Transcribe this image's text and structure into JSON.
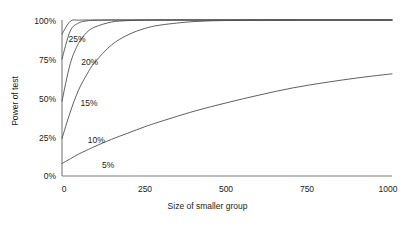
{
  "chart_data": {
    "type": "line",
    "title": "",
    "xlabel": "Size of smaller group",
    "ylabel": "Power of test",
    "xlim": [
      0,
      1000
    ],
    "ylim": [
      0,
      100
    ],
    "grid": false,
    "legend_position": "inline-labels",
    "xticks": [
      "0",
      "250",
      "500",
      "750",
      "1000"
    ],
    "xtick_values": [
      0,
      250,
      500,
      750,
      1000
    ],
    "yticks": [
      "0%",
      "25%",
      "50%",
      "75%",
      "100%"
    ],
    "ytick_values": [
      0,
      25,
      50,
      75,
      100
    ],
    "x": [
      0,
      25,
      50,
      75,
      100,
      150,
      200,
      250,
      300,
      400,
      500,
      600,
      700,
      800,
      900,
      1000
    ],
    "series": [
      {
        "name": "25%",
        "label": "25%",
        "values": [
          91,
          99.2,
          99.9,
          100,
          100,
          100,
          100,
          100,
          100,
          100,
          100,
          100,
          100,
          100,
          100,
          100
        ]
      },
      {
        "name": "20%",
        "label": "20%",
        "values": [
          75,
          93,
          98,
          99.4,
          99.8,
          100,
          100,
          100,
          100,
          100,
          100,
          100,
          100,
          100,
          100,
          100
        ]
      },
      {
        "name": "15%",
        "label": "15%",
        "values": [
          48,
          72,
          85,
          92,
          95.5,
          98.7,
          99.6,
          99.9,
          100,
          100,
          100,
          100,
          100,
          100,
          100,
          100
        ]
      },
      {
        "name": "10%",
        "label": "10%",
        "values": [
          24,
          41,
          55,
          65,
          73,
          84,
          90.5,
          94.5,
          96.8,
          99,
          99.7,
          99.95,
          100,
          100,
          100,
          100
        ]
      },
      {
        "name": "5%",
        "label": "5%",
        "values": [
          8,
          11,
          14,
          16.5,
          19,
          23.5,
          27.5,
          31.5,
          35,
          41.5,
          47,
          52,
          56.5,
          60,
          63,
          65.5
        ]
      }
    ],
    "series_label_positions": [
      {
        "name": "25%",
        "x": 14,
        "y": 88
      },
      {
        "name": "20%",
        "x": 52,
        "y": 73
      },
      {
        "name": "15%",
        "x": 50,
        "y": 47
      },
      {
        "name": "10%",
        "x": 72,
        "y": 23
      },
      {
        "name": "5%",
        "x": 115,
        "y": 7
      }
    ],
    "colors": {
      "line": "#4d4d4d",
      "axis": "#7a7a7a",
      "text": "#1a1a1a",
      "background": "#ffffff"
    }
  }
}
